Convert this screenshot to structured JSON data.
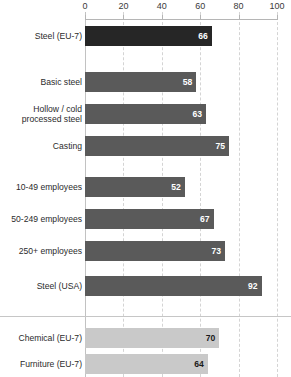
{
  "chart_data": {
    "type": "bar",
    "orientation": "horizontal",
    "title": "",
    "subtitle": "",
    "xlabel": "",
    "ylabel": "",
    "xlim": [
      0,
      100
    ],
    "xticks": [
      0,
      20,
      40,
      60,
      80,
      100
    ],
    "xtick_labels": [
      "0",
      "20",
      "40",
      "60",
      "80",
      "100"
    ],
    "grid": true,
    "grid_style": "dashed vertical gridlines at each x tick",
    "legend": "none",
    "categories": [
      "Steel (EU-7)",
      "Basic steel",
      "Hollow / cold\nprocessed steel",
      "Casting",
      "10-49 employees",
      "50-249 employees",
      "250+ employees",
      "Steel (USA)",
      "Chemical (EU-7)",
      "Furniture (EU-7)"
    ],
    "values": [
      66,
      58,
      63,
      75,
      52,
      67,
      73,
      92,
      70,
      64
    ],
    "colors": {
      "highlight_dark": "#262626",
      "medium_gray": "#5a5a5a",
      "light_gray": "#c9c9c9",
      "gridline": "#d4d4d4",
      "axis": "#b5b5b5"
    },
    "bars": [
      {
        "label": "Steel (EU-7)",
        "value": 66,
        "color": "#262626",
        "value_color": "light",
        "top": 26,
        "group": 1
      },
      {
        "label": "Basic steel",
        "value": 58,
        "color": "#5a5a5a",
        "value_color": "light",
        "top": 72,
        "group": 2
      },
      {
        "label": "Hollow / cold\nprocessed steel",
        "value": 63,
        "color": "#5a5a5a",
        "value_color": "light",
        "top": 104,
        "group": 2
      },
      {
        "label": "Casting",
        "value": 75,
        "color": "#5a5a5a",
        "value_color": "light",
        "top": 136,
        "group": 2
      },
      {
        "label": "10-49 employees",
        "value": 52,
        "color": "#5a5a5a",
        "value_color": "light",
        "top": 177,
        "group": 3
      },
      {
        "label": "50-249 employees",
        "value": 67,
        "color": "#5a5a5a",
        "value_color": "light",
        "top": 209,
        "group": 3
      },
      {
        "label": "250+ employees",
        "value": 73,
        "color": "#5a5a5a",
        "value_color": "light",
        "top": 241,
        "group": 3
      },
      {
        "label": "Steel (USA)",
        "value": 92,
        "color": "#5a5a5a",
        "value_color": "light",
        "top": 276,
        "group": 4
      },
      {
        "label": "Chemical (EU-7)",
        "value": 70,
        "color": "#c9c9c9",
        "value_color": "dark",
        "top": 328,
        "group": 5
      },
      {
        "label": "Furniture (EU-7)",
        "value": 64,
        "color": "#c9c9c9",
        "value_color": "dark",
        "top": 354,
        "group": 5
      }
    ]
  }
}
